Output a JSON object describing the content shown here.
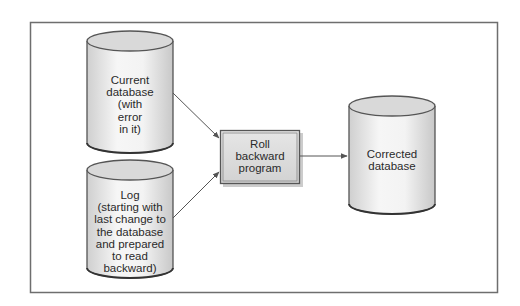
{
  "diagram": {
    "type": "flow",
    "frame": {
      "x": 30,
      "y": 22,
      "width": 467,
      "height": 270,
      "stroke": "#6e6e6e"
    },
    "nodes": [
      {
        "id": "current_db",
        "shape": "cylinder",
        "label": "Current\ndatabase\n(with\nerror\nin it)"
      },
      {
        "id": "log",
        "shape": "cylinder",
        "label": "Log\n(starting with\nlast change to\nthe database\nand prepared\nto read\nbackward)"
      },
      {
        "id": "rollback_program",
        "shape": "box",
        "label": "Roll\nbackward\nprogram"
      },
      {
        "id": "corrected_db",
        "shape": "cylinder",
        "label": "Corrected\ndatabase"
      }
    ],
    "edges": [
      {
        "from": "current_db",
        "to": "rollback_program"
      },
      {
        "from": "log",
        "to": "rollback_program"
      },
      {
        "from": "rollback_program",
        "to": "corrected_db"
      }
    ],
    "colors": {
      "cylinder_body": "#efefef",
      "cylinder_top": "#d9d9d9",
      "box_fill": "#dcdcdc",
      "stroke": "#555555",
      "arrow": "#555555"
    }
  }
}
